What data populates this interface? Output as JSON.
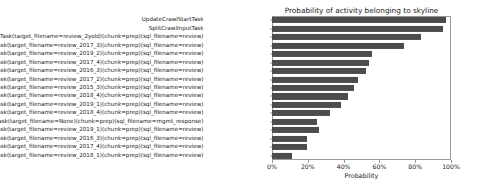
{
  "chart_data": {
    "type": "bar",
    "orientation": "horizontal",
    "title": "Probability of activity belonging to skyline",
    "xlabel": "Probability",
    "ylabel": "",
    "xlim": [
      0,
      100
    ],
    "xticks": [
      0,
      20,
      40,
      60,
      80,
      100
    ],
    "xticklabels": [
      "0%",
      "20%",
      "40%",
      "60%",
      "80%",
      "100%"
    ],
    "grid": false,
    "legend": null,
    "bar_color": "#4c4c4c",
    "categories": [
      "UpdateCrawlStartTask",
      "SplitCrawlInputTask",
      "DumpTask(target_filename=review_2yold)(chunk=prep)(sql_filename=review)",
      "ConvertDumpTask(target_filename=review_2017_3)(chunk=prep)(sql_filename=review)",
      "ConvertDumpTask(target_filename=review_2019_2)(chunk=prep)(sql_filename=review)",
      "DumpTask(target_filename=review_2017_4)(chunk=prep)(sql_filename=review)",
      "DumpTask(target_filename=review_2016_3)(chunk=prep)(sql_filename=review)",
      "DumpTask(target_filename=review_2017_2)(chunk=prep)(sql_filename=review)",
      "DumpTask(target_filename=review_2015_3)(chunk=prep)(sql_filename=review)",
      "DumpTask(target_filename=review_2018_4)(chunk=prep)(sql_filename=review)",
      "DumpTask(target_filename=review_2019_1)(chunk=prep)(sql_filename=review)",
      "ConvertDumpTask(target_filename=review_2018_4)(chunk=prep)(sql_filename=review)",
      "ConvertDumpTask(target_filename=None)(chunk=prep)(sql_filename=mgmt_response)",
      "ConvertDumpTask(target_filename=review_2019_1)(chunk=prep)(sql_filename=review)",
      "ConvertDumpTask(target_filename=review_2016_3)(chunk=prep)(sql_filename=review)",
      "ConvertDumpTask(target_filename=review_2017_4)(chunk=prep)(sql_filename=review)",
      "ConvertDumpTask(target_filename=review_2018_1)(chunk=prep)(sql_filename=review)"
    ],
    "values": [
      97,
      95.5,
      83,
      74,
      56,
      54,
      52.5,
      48,
      46,
      42.5,
      38.5,
      32.5,
      25,
      26,
      19.5,
      19.5,
      11
    ]
  }
}
